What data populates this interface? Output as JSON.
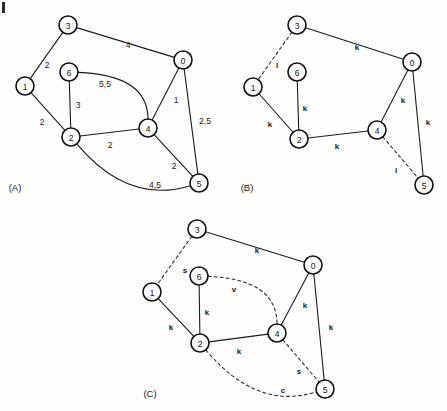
{
  "figure": {
    "width": 447,
    "height": 411,
    "background": "#fdfdfc",
    "ink": "#1a1a1a",
    "corner_mark": "|"
  },
  "panels": [
    {
      "id": "A",
      "caption": "(A)",
      "caption_pos": {
        "x": 15,
        "y": 187
      },
      "node_radius": 9,
      "nodes": [
        {
          "id": "n3",
          "label": "3",
          "x": 68,
          "y": 25
        },
        {
          "id": "n0",
          "label": "0",
          "x": 183,
          "y": 60
        },
        {
          "id": "n6",
          "label": "6",
          "x": 69,
          "y": 72
        },
        {
          "id": "n1",
          "label": "1",
          "x": 25,
          "y": 86
        },
        {
          "id": "n4",
          "label": "4",
          "x": 148,
          "y": 128
        },
        {
          "id": "n2",
          "label": "2",
          "x": 71,
          "y": 137
        },
        {
          "id": "n5",
          "label": "5",
          "x": 199,
          "y": 183
        }
      ],
      "edges": [
        {
          "id": "e3-0",
          "from": "n3",
          "to": "n0",
          "style": "solid",
          "shape": "line",
          "label": "4",
          "label_pos": {
            "x": 128,
            "y": 45
          }
        },
        {
          "id": "e3-1",
          "from": "n3",
          "to": "n1",
          "style": "solid",
          "shape": "line",
          "label": "2",
          "label_pos": {
            "x": 47,
            "y": 65
          }
        },
        {
          "id": "e1-2",
          "from": "n1",
          "to": "n2",
          "style": "solid",
          "shape": "line",
          "label": "2",
          "label_pos": {
            "x": 42,
            "y": 122
          }
        },
        {
          "id": "e6-2",
          "from": "n6",
          "to": "n2",
          "style": "solid",
          "shape": "line",
          "label": "3",
          "label_pos": {
            "x": 78,
            "y": 105
          }
        },
        {
          "id": "e6-4",
          "from": "n6",
          "to": "n4",
          "style": "solid",
          "shape": "curve",
          "curve": {
            "cx": 148,
            "cy": 75
          },
          "label": "5,5",
          "label_pos": {
            "x": 105,
            "y": 84
          }
        },
        {
          "id": "e2-4",
          "from": "n2",
          "to": "n4",
          "style": "solid",
          "shape": "line",
          "label": "2",
          "label_pos": {
            "x": 110,
            "y": 145
          }
        },
        {
          "id": "e0-4",
          "from": "n0",
          "to": "n4",
          "style": "solid",
          "shape": "line",
          "label": "1",
          "label_pos": {
            "x": 176,
            "y": 100
          }
        },
        {
          "id": "e0-5",
          "from": "n0",
          "to": "n5",
          "style": "solid",
          "shape": "line",
          "label": "2,5",
          "label_pos": {
            "x": 205,
            "y": 121
          }
        },
        {
          "id": "e4-5",
          "from": "n4",
          "to": "n5",
          "style": "solid",
          "shape": "line",
          "label": "2",
          "label_pos": {
            "x": 174,
            "y": 166
          }
        },
        {
          "id": "e2-5",
          "from": "n2",
          "to": "n5",
          "style": "solid",
          "shape": "curve",
          "curve": {
            "cx": 128,
            "cy": 205
          },
          "label": "4,5",
          "label_pos": {
            "x": 155,
            "y": 185
          }
        }
      ]
    },
    {
      "id": "B",
      "caption": "(B)",
      "caption_pos": {
        "x": 247,
        "y": 187
      },
      "node_radius": 9,
      "nodes": [
        {
          "id": "n3",
          "label": "3",
          "x": 297,
          "y": 25
        },
        {
          "id": "n0",
          "label": "0",
          "x": 412,
          "y": 62
        },
        {
          "id": "n6",
          "label": "6",
          "x": 297,
          "y": 72
        },
        {
          "id": "n1",
          "label": "1",
          "x": 253,
          "y": 87
        },
        {
          "id": "n4",
          "label": "4",
          "x": 377,
          "y": 130
        },
        {
          "id": "n2",
          "label": "2",
          "x": 299,
          "y": 139
        },
        {
          "id": "n5",
          "label": "5",
          "x": 424,
          "y": 185
        }
      ],
      "edges": [
        {
          "id": "e3-0",
          "from": "n3",
          "to": "n0",
          "style": "solid",
          "shape": "line",
          "label": "k",
          "label_pos": {
            "x": 357,
            "y": 47
          }
        },
        {
          "id": "e3-1",
          "from": "n3",
          "to": "n1",
          "style": "dashed",
          "shape": "line",
          "label": "l",
          "label_pos": {
            "x": 277,
            "y": 65
          }
        },
        {
          "id": "e1-2",
          "from": "n1",
          "to": "n2",
          "style": "solid",
          "shape": "line",
          "label": "k",
          "label_pos": {
            "x": 270,
            "y": 124
          }
        },
        {
          "id": "e6-2",
          "from": "n6",
          "to": "n2",
          "style": "solid",
          "shape": "line",
          "label": "k",
          "label_pos": {
            "x": 305,
            "y": 108
          }
        },
        {
          "id": "e2-4",
          "from": "n2",
          "to": "n4",
          "style": "solid",
          "shape": "line",
          "label": "k",
          "label_pos": {
            "x": 337,
            "y": 146
          }
        },
        {
          "id": "e0-4",
          "from": "n0",
          "to": "n4",
          "style": "solid",
          "shape": "line",
          "label": "k",
          "label_pos": {
            "x": 403,
            "y": 100
          }
        },
        {
          "id": "e0-5",
          "from": "n0",
          "to": "n5",
          "style": "solid",
          "shape": "line",
          "label": "k",
          "label_pos": {
            "x": 428,
            "y": 122
          }
        },
        {
          "id": "e4-5",
          "from": "n4",
          "to": "n5",
          "style": "dashed",
          "shape": "line",
          "label": "l",
          "label_pos": {
            "x": 396,
            "y": 170
          }
        }
      ]
    },
    {
      "id": "C",
      "caption": "(C)",
      "caption_pos": {
        "x": 150,
        "y": 393
      },
      "node_radius": 9,
      "nodes": [
        {
          "id": "n3",
          "label": "3",
          "x": 197,
          "y": 229
        },
        {
          "id": "n0",
          "label": "0",
          "x": 313,
          "y": 265
        },
        {
          "id": "n6",
          "label": "6",
          "x": 199,
          "y": 276
        },
        {
          "id": "n1",
          "label": "1",
          "x": 152,
          "y": 292
        },
        {
          "id": "n4",
          "label": "4",
          "x": 277,
          "y": 333
        },
        {
          "id": "n2",
          "label": "2",
          "x": 200,
          "y": 343
        },
        {
          "id": "n5",
          "label": "5",
          "x": 325,
          "y": 389
        }
      ],
      "edges": [
        {
          "id": "e3-0",
          "from": "n3",
          "to": "n0",
          "style": "solid",
          "shape": "line",
          "label": "k",
          "label_pos": {
            "x": 257,
            "y": 250
          }
        },
        {
          "id": "e3-1",
          "from": "n3",
          "to": "n1",
          "style": "dashed",
          "shape": "line",
          "label": "s",
          "label_pos": {
            "x": 185,
            "y": 270
          }
        },
        {
          "id": "e1-2",
          "from": "n1",
          "to": "n2",
          "style": "solid",
          "shape": "line",
          "label": "k",
          "label_pos": {
            "x": 171,
            "y": 327
          }
        },
        {
          "id": "e6-2",
          "from": "n6",
          "to": "n2",
          "style": "solid",
          "shape": "line",
          "label": "k",
          "label_pos": {
            "x": 207,
            "y": 312
          }
        },
        {
          "id": "e6-4",
          "from": "n6",
          "to": "n4",
          "style": "dashed",
          "shape": "curve",
          "curve": {
            "cx": 277,
            "cy": 279
          },
          "label": "v",
          "label_pos": {
            "x": 234,
            "y": 289
          }
        },
        {
          "id": "e2-4",
          "from": "n2",
          "to": "n4",
          "style": "solid",
          "shape": "line",
          "label": "k",
          "label_pos": {
            "x": 239,
            "y": 351
          }
        },
        {
          "id": "e0-4",
          "from": "n0",
          "to": "n4",
          "style": "solid",
          "shape": "line",
          "label": "k",
          "label_pos": {
            "x": 305,
            "y": 305
          }
        },
        {
          "id": "e0-5",
          "from": "n0",
          "to": "n5",
          "style": "solid",
          "shape": "line",
          "label": "k",
          "label_pos": {
            "x": 331,
            "y": 327
          }
        },
        {
          "id": "e4-5",
          "from": "n4",
          "to": "n5",
          "style": "dashed",
          "shape": "line",
          "label": "s",
          "label_pos": {
            "x": 299,
            "y": 371
          }
        },
        {
          "id": "e2-5",
          "from": "n2",
          "to": "n5",
          "style": "dashed",
          "shape": "curve",
          "curve": {
            "cx": 257,
            "cy": 411
          },
          "label": "c",
          "label_pos": {
            "x": 283,
            "y": 390
          }
        }
      ]
    }
  ]
}
